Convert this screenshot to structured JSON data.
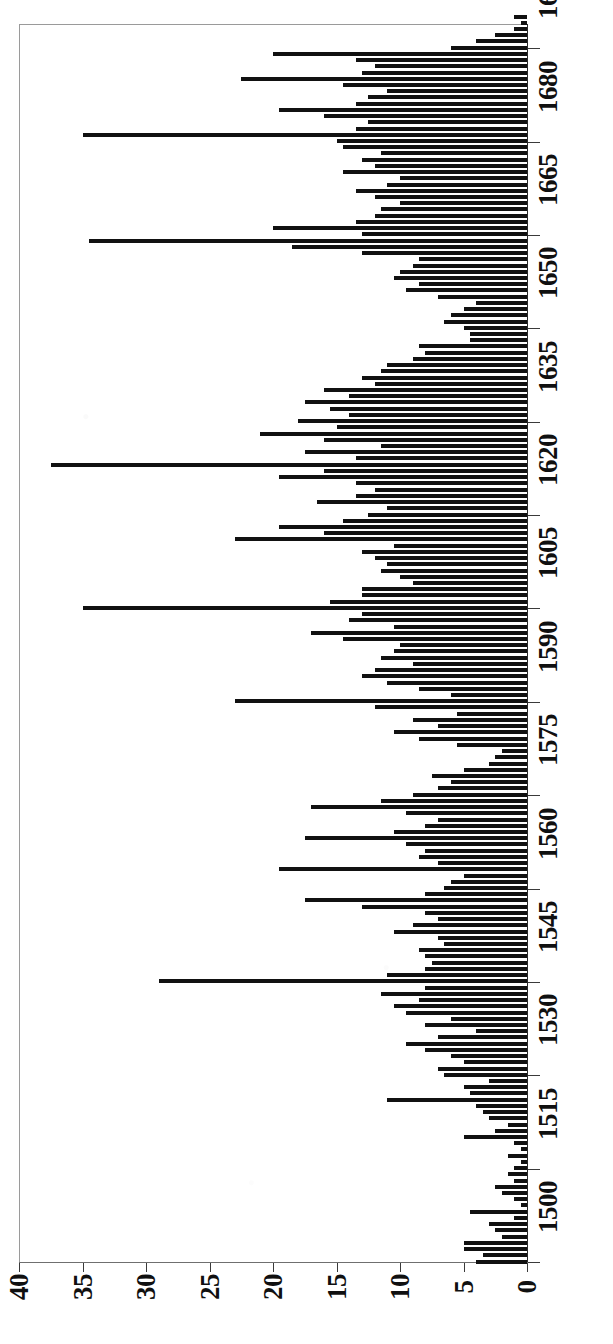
{
  "chart_data": {
    "type": "bar",
    "orientation": "rotated-90",
    "title": "",
    "subtitle": "",
    "xlabel": "",
    "ylabel": "",
    "xlim": [
      1499,
      1701
    ],
    "ylim": [
      0,
      40
    ],
    "grid": false,
    "legend": null,
    "bar_color": "#111111",
    "axis_color": "#3a3a3a",
    "value_axis": {
      "name": "count",
      "ticks": [
        0,
        5,
        10,
        15,
        20,
        25,
        30,
        35,
        40
      ],
      "tick_labels": [
        "0",
        "5",
        "10",
        "15",
        "20",
        "25",
        "30",
        "35",
        "40"
      ],
      "direction": "right-to-left",
      "zero_at": "right"
    },
    "category_axis": {
      "name": "year",
      "ticks": [
        1500,
        1515,
        1530,
        1545,
        1560,
        1575,
        1590,
        1605,
        1620,
        1635,
        1650,
        1665,
        1680,
        1695
      ],
      "tick_labels": [
        "1500",
        "1515",
        "1530",
        "1545",
        "1560",
        "1575",
        "1590",
        "1605",
        "1620",
        "1635",
        "1650",
        "1665",
        "1680",
        "1695"
      ],
      "direction": "bottom-to-top"
    },
    "categories": [
      1500,
      1501,
      1502,
      1503,
      1504,
      1505,
      1506,
      1507,
      1508,
      1509,
      1510,
      1511,
      1512,
      1513,
      1514,
      1515,
      1516,
      1517,
      1518,
      1519,
      1520,
      1521,
      1522,
      1523,
      1524,
      1525,
      1526,
      1527,
      1528,
      1529,
      1530,
      1531,
      1532,
      1533,
      1534,
      1535,
      1536,
      1537,
      1538,
      1539,
      1540,
      1541,
      1542,
      1543,
      1544,
      1545,
      1546,
      1547,
      1548,
      1549,
      1550,
      1551,
      1552,
      1553,
      1554,
      1555,
      1556,
      1557,
      1558,
      1559,
      1560,
      1561,
      1562,
      1563,
      1564,
      1565,
      1566,
      1567,
      1568,
      1569,
      1570,
      1571,
      1572,
      1573,
      1574,
      1575,
      1576,
      1577,
      1578,
      1579,
      1580,
      1581,
      1582,
      1583,
      1584,
      1585,
      1586,
      1587,
      1588,
      1589,
      1590,
      1591,
      1592,
      1593,
      1594,
      1595,
      1596,
      1597,
      1598,
      1599,
      1600,
      1601,
      1602,
      1603,
      1604,
      1605,
      1606,
      1607,
      1608,
      1609,
      1610,
      1611,
      1612,
      1613,
      1614,
      1615,
      1616,
      1617,
      1618,
      1619,
      1620,
      1621,
      1622,
      1623,
      1624,
      1625,
      1626,
      1627,
      1628,
      1629,
      1630,
      1631,
      1632,
      1633,
      1634,
      1635,
      1636,
      1637,
      1638,
      1639,
      1640,
      1641,
      1642,
      1643,
      1644,
      1645,
      1646,
      1647,
      1648,
      1649,
      1650,
      1651,
      1652,
      1653,
      1654,
      1655,
      1656,
      1657,
      1658,
      1659,
      1660,
      1661,
      1662,
      1663,
      1664,
      1665,
      1666,
      1667,
      1668,
      1669,
      1670,
      1671,
      1672,
      1673,
      1674,
      1675,
      1676,
      1677,
      1678,
      1679,
      1680,
      1681,
      1682,
      1683,
      1684,
      1685,
      1686,
      1687,
      1688,
      1689,
      1690,
      1691,
      1692,
      1693,
      1694,
      1695,
      1696,
      1697,
      1698,
      1699,
      1700
    ],
    "values": [
      4.0,
      3.5,
      5.0,
      5.0,
      2.0,
      2.5,
      3.0,
      1.0,
      4.5,
      0.5,
      1.0,
      2.0,
      2.5,
      1.0,
      1.5,
      1.0,
      0.5,
      1.5,
      0.5,
      1.0,
      5.0,
      2.5,
      1.5,
      3.0,
      3.5,
      4.0,
      11.0,
      4.5,
      5.0,
      3.0,
      6.5,
      7.0,
      5.0,
      6.0,
      8.0,
      9.5,
      7.0,
      4.0,
      8.0,
      6.0,
      9.5,
      10.5,
      8.5,
      11.5,
      8.0,
      29.0,
      11.0,
      8.0,
      7.5,
      8.0,
      8.5,
      6.5,
      7.0,
      10.5,
      9.0,
      7.0,
      8.0,
      13.0,
      17.5,
      8.0,
      6.5,
      6.0,
      5.0,
      19.5,
      7.0,
      8.5,
      8.0,
      9.5,
      17.5,
      10.5,
      8.0,
      7.0,
      9.5,
      17.0,
      11.5,
      9.0,
      7.0,
      6.0,
      7.5,
      5.0,
      3.0,
      2.5,
      2.0,
      5.5,
      8.5,
      10.5,
      7.0,
      9.0,
      5.5,
      12.0,
      23.0,
      6.0,
      8.5,
      11.0,
      13.0,
      12.0,
      9.0,
      11.5,
      10.5,
      10.0,
      14.5,
      17.0,
      10.5,
      14.0,
      13.0,
      35.0,
      15.5,
      13.0,
      13.0,
      9.0,
      10.0,
      11.5,
      11.0,
      12.0,
      13.0,
      10.5,
      23.0,
      16.0,
      19.5,
      14.5,
      12.5,
      11.0,
      16.5,
      13.5,
      12.0,
      13.5,
      19.5,
      16.0,
      37.5,
      13.5,
      17.5,
      11.5,
      16.0,
      21.0,
      15.0,
      18.0,
      14.0,
      15.5,
      17.5,
      14.0,
      16.0,
      12.0,
      13.0,
      11.5,
      11.0,
      9.0,
      8.0,
      8.5,
      4.5,
      4.5,
      5.0,
      6.5,
      6.0,
      5.0,
      4.0,
      7.0,
      9.5,
      8.5,
      10.5,
      10.0,
      9.0,
      8.5,
      13.0,
      18.5,
      34.5,
      13.0,
      20.0,
      13.5,
      12.0,
      11.5,
      10.0,
      12.0,
      13.5,
      11.0,
      10.0,
      14.5,
      12.0,
      13.0,
      11.5,
      14.5,
      15.0,
      35.0,
      13.5,
      12.5,
      16.0,
      19.5,
      13.5,
      12.5,
      11.0,
      14.5,
      22.5,
      13.0,
      12.0,
      13.5,
      20.0,
      6.0,
      4.0,
      2.5,
      1.0,
      0.5,
      1.0
    ]
  }
}
